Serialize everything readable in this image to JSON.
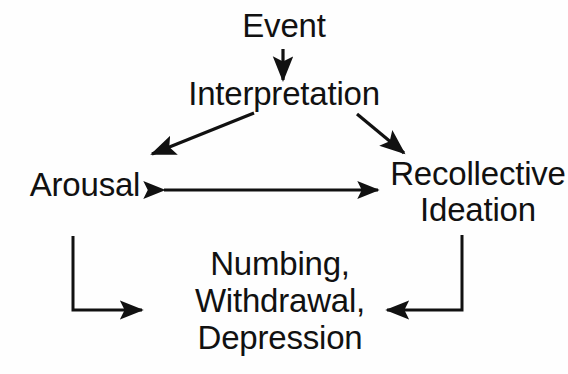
{
  "diagram": {
    "background_color": "#fefefe",
    "ink_color": "#111111",
    "nodes": {
      "event": "Event",
      "interpretation": "Interpretation",
      "arousal": "Arousal",
      "recollective_line1": "Recollective",
      "recollective_line2": "Ideation",
      "outcome_line1": "Numbing,",
      "outcome_line2": "Withdrawal,",
      "outcome_line3": "Depression"
    },
    "edges": [
      {
        "name": "event-to-interpretation",
        "from": "Event",
        "to": "Interpretation",
        "style": "straight-vertical",
        "heads": "end"
      },
      {
        "name": "interpretation-to-arousal",
        "from": "Interpretation",
        "to": "Arousal",
        "style": "diagonal-down-left",
        "heads": "end"
      },
      {
        "name": "interpretation-to-recollective-ideation",
        "from": "Interpretation",
        "to": "Recollective Ideation",
        "style": "diagonal-down-right",
        "heads": "end"
      },
      {
        "name": "arousal-recollective-ideation",
        "from": "Arousal",
        "to": "Recollective Ideation",
        "style": "horizontal",
        "heads": "both"
      },
      {
        "name": "arousal-to-outcome",
        "from": "Arousal",
        "to": "Numbing, Withdrawal, Depression",
        "style": "elbow-down-right",
        "heads": "end"
      },
      {
        "name": "recollective-ideation-to-outcome",
        "from": "Recollective Ideation",
        "to": "Numbing, Withdrawal, Depression",
        "style": "elbow-down-left",
        "heads": "end"
      }
    ]
  }
}
